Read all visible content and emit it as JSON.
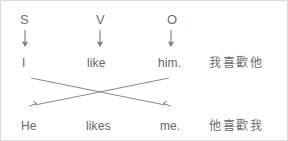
{
  "diagram": {
    "title_role_row": {
      "items": [
        {
          "label": "S",
          "name": "role-label-subject"
        },
        {
          "label": "V",
          "name": "role-label-verb"
        },
        {
          "label": "O",
          "name": "role-label-object"
        }
      ]
    },
    "arrow_row": {
      "items": [
        {
          "glyph": "down-arrow-icon"
        },
        {
          "glyph": "down-arrow-icon"
        },
        {
          "glyph": "down-arrow-icon"
        }
      ]
    },
    "sentence_top": {
      "subject": "I",
      "verb": "like",
      "object": "him.",
      "gloss": "我喜歡他"
    },
    "sentence_bottom": {
      "subject": "He",
      "verb": "likes",
      "object": "me.",
      "gloss": "他喜歡我"
    },
    "cross_arrows": [
      {
        "name": "arrow-subject-to-object",
        "from": "I",
        "to": "me.",
        "direction": "down-right"
      },
      {
        "name": "arrow-object-to-subject",
        "from": "him.",
        "to": "He",
        "direction": "down-left"
      }
    ],
    "colors": {
      "text": "#6b6b6b",
      "line": "#7a7a7a",
      "background": "#ffffff",
      "border": "#dcdcdc"
    }
  }
}
